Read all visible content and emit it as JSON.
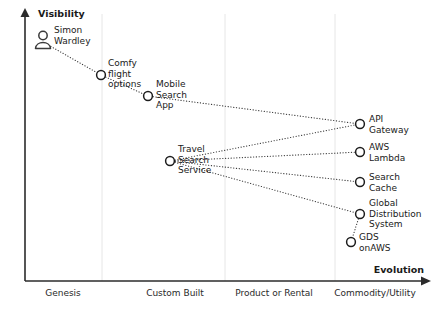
{
  "diagram": {
    "type": "wardley-map",
    "axes": {
      "y_title": "Visibility",
      "x_title": "Evolution",
      "x_stages": [
        {
          "label": "Genesis",
          "x": 63
        },
        {
          "label": "Custom Built",
          "x": 175
        },
        {
          "label": "Product or Rental",
          "x": 274
        },
        {
          "label": "Commodity/Utility",
          "x": 375
        }
      ],
      "gridlines_x": [
        102,
        225,
        335
      ],
      "origin": {
        "x": 25,
        "y": 281
      },
      "y_axis_top": 10,
      "x_axis_right": 428
    },
    "nodes": [
      {
        "id": "simon-wardley",
        "label": [
          "Simon",
          "Wardley"
        ],
        "x": 43,
        "y": 42,
        "shape": "person",
        "label_x": 54,
        "label_y": 33
      },
      {
        "id": "comfy-flight-options",
        "label": [
          "Comfy",
          "flight",
          "options"
        ],
        "x": 101,
        "y": 75,
        "shape": "circle",
        "label_x": 108,
        "label_y": 66
      },
      {
        "id": "mobile-search-app",
        "label": [
          "Mobile",
          "Search",
          "App"
        ],
        "x": 148,
        "y": 96,
        "shape": "circle",
        "label_x": 156,
        "label_y": 87
      },
      {
        "id": "travel-search-service",
        "label": [
          "Travel",
          "Search",
          "Service"
        ],
        "x": 170,
        "y": 161,
        "shape": "circle",
        "label_x": 178,
        "label_y": 152
      },
      {
        "id": "api-gateway",
        "label": [
          "API",
          "Gateway"
        ],
        "x": 360,
        "y": 124,
        "shape": "circle",
        "label_x": 369,
        "label_y": 122
      },
      {
        "id": "aws-lambda",
        "label": [
          "AWS",
          "Lambda"
        ],
        "x": 360,
        "y": 152,
        "shape": "circle",
        "label_x": 369,
        "label_y": 150
      },
      {
        "id": "search-cache",
        "label": [
          "Search",
          "Cache"
        ],
        "x": 360,
        "y": 182,
        "shape": "circle",
        "label_x": 369,
        "label_y": 180
      },
      {
        "id": "global-distribution-system",
        "label": [
          "Global",
          "Distribution",
          "System"
        ],
        "x": 360,
        "y": 214,
        "shape": "circle",
        "label_x": 369,
        "label_y": 206
      },
      {
        "id": "gds-onaws",
        "label": [
          "GDS",
          "onAWS"
        ],
        "x": 351,
        "y": 242,
        "shape": "circle",
        "label_x": 359,
        "label_y": 240
      }
    ],
    "links": [
      {
        "from": "simon-wardley",
        "to": "comfy-flight-options"
      },
      {
        "from": "comfy-flight-options",
        "to": "mobile-search-app"
      },
      {
        "from": "mobile-search-app",
        "to": "api-gateway"
      },
      {
        "from": "travel-search-service",
        "to": "api-gateway"
      },
      {
        "from": "travel-search-service",
        "to": "aws-lambda"
      },
      {
        "from": "travel-search-service",
        "to": "search-cache"
      },
      {
        "from": "travel-search-service",
        "to": "global-distribution-system"
      },
      {
        "from": "global-distribution-system",
        "to": "gds-onaws"
      }
    ],
    "colors": {
      "axis": "#2b2b2b",
      "grid": "#e6e6e6",
      "node_stroke": "#1d1d1d",
      "link": "#3b3b3b",
      "text": "#1a1a1a",
      "background": "#ffffff"
    }
  }
}
